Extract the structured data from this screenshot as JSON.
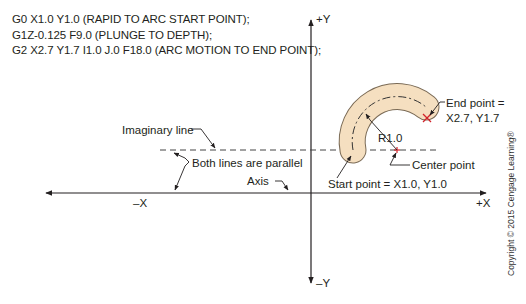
{
  "code_block": {
    "lines": [
      "G0 X1.0 Y1.0 (RAPID TO ARC START POINT);",
      "G1Z-0.125 F9.0 (PLUNGE TO DEPTH);",
      "G2 X2.7 Y1.7 I1.0 J.0 F18.0 (ARC MOTION TO END POINT);"
    ]
  },
  "axes": {
    "plus_y": "+Y",
    "minus_y": "–Y",
    "plus_x": "+X",
    "minus_x": "–X"
  },
  "annotations": {
    "imaginary_line": "Imaginary line",
    "both_parallel": "Both lines are parallel",
    "axis": "Axis",
    "radius": "R1.0",
    "center_point": "Center point",
    "start_point": "Start point = X1.0, Y1.0",
    "end_point_line1": "End point =",
    "end_point_line2": "X2.7, Y1.7"
  },
  "colors": {
    "arc_fill": "#f5dfc0",
    "arc_stroke": "#7a6a55",
    "marker": "#d2232a",
    "axis": "#231f20"
  },
  "copyright": "Copyright © 2015 Cengage Learning®"
}
